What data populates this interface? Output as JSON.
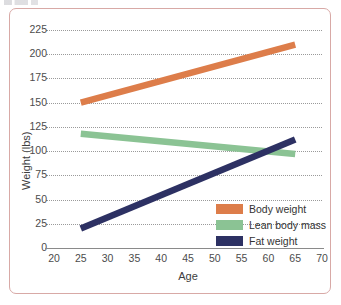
{
  "chart_data": {
    "type": "line",
    "title": "",
    "xlabel": "Age",
    "ylabel": "Weight (lbs)",
    "xlim": [
      20,
      70
    ],
    "ylim": [
      0,
      225
    ],
    "grid": "horizontal-dotted",
    "legend_position": "inside-lower-right",
    "x_ticks": [
      "20",
      "25",
      "30",
      "35",
      "40",
      "45",
      "50",
      "55",
      "60",
      "65",
      "70"
    ],
    "y_ticks": [
      "0",
      "25",
      "50",
      "75",
      "100",
      "125",
      "150",
      "175",
      "200",
      "225"
    ],
    "series": [
      {
        "name": "Body weight",
        "color": "#dd7d4a",
        "x": [
          25,
          65
        ],
        "values": [
          150,
          210
        ]
      },
      {
        "name": "Lean body mass",
        "color": "#8bc394",
        "x": [
          25,
          65
        ],
        "values": [
          118,
          97
        ]
      },
      {
        "name": "Fat weight",
        "color": "#2d3163",
        "x": [
          25,
          65
        ],
        "values": [
          20,
          112
        ]
      }
    ]
  },
  "axes": {
    "y_title": "Weight (lbs)",
    "x_title": "Age",
    "y_tick_labels": [
      "225",
      "200",
      "175",
      "150",
      "125",
      "100",
      "75",
      "50",
      "25",
      "0"
    ],
    "x_tick_labels": [
      "20",
      "25",
      "30",
      "35",
      "40",
      "45",
      "50",
      "55",
      "60",
      "65",
      "70"
    ]
  },
  "legend": {
    "items": [
      {
        "label": "Body weight",
        "color": "#dd7d4a"
      },
      {
        "label": "Lean body mass",
        "color": "#8bc394"
      },
      {
        "label": "Fat weight",
        "color": "#2d3163"
      }
    ]
  },
  "style": {
    "frame_color": "#d8a9a6",
    "grid_color": "#9a9a9a",
    "axis_color": "#8a8a8a",
    "text_color": "#3d3d3d"
  }
}
